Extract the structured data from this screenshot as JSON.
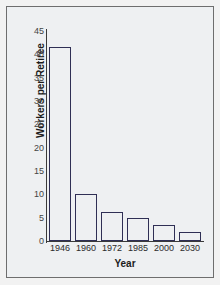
{
  "chart_data": {
    "type": "bar",
    "title": "",
    "xlabel": "Year",
    "ylabel": "Workers per Retiree",
    "categories": [
      "1946",
      "1960",
      "1972",
      "1985",
      "2000",
      "2030"
    ],
    "values": [
      41.5,
      10,
      6.2,
      5,
      3.5,
      2
    ],
    "series": [
      {
        "name": "Workers per Retiree",
        "values": [
          41.5,
          10,
          6.2,
          5,
          3.5,
          2
        ]
      }
    ],
    "ylim": [
      0,
      45
    ],
    "yticks": [
      0,
      5,
      10,
      15,
      20,
      25,
      30,
      35,
      40,
      45
    ],
    "ytick_labels": [
      "0",
      "5",
      "10",
      "15",
      "20",
      "25",
      "30",
      "35",
      "40",
      "45"
    ],
    "grid": false,
    "legend": false,
    "bar_color_top": "#f4f4fb",
    "bar_color_bottom": "#4a3fae",
    "bar_edge_color": "#2f2f55",
    "plot_background": "#eef0f2",
    "frame_color": "#6e6e6e"
  }
}
